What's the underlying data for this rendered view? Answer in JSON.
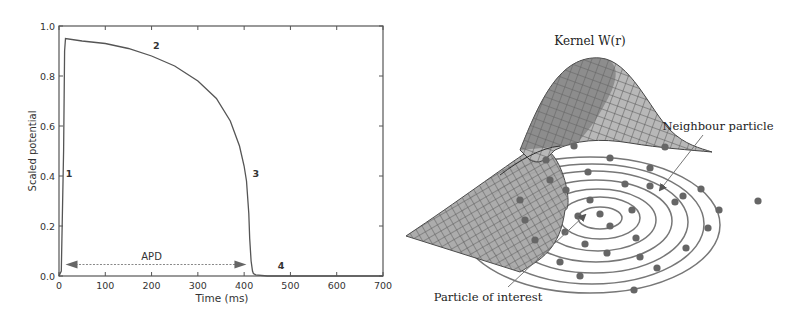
{
  "chart_data": {
    "type": "line",
    "title": "",
    "xlabel": "Time (ms)",
    "ylabel": "Scaled potential",
    "xlim": [
      0,
      700
    ],
    "ylim": [
      0.0,
      1.0
    ],
    "xticks": [
      "0",
      "100",
      "200",
      "300",
      "400",
      "500",
      "600",
      "700"
    ],
    "yticks": [
      "0.0",
      "0.2",
      "0.4",
      "0.6",
      "0.8",
      "1.0"
    ],
    "grid": false,
    "series": [
      {
        "name": "Action potential",
        "x": [
          0,
          5,
          10,
          12,
          14,
          50,
          100,
          150,
          200,
          250,
          300,
          340,
          370,
          390,
          400,
          405,
          410,
          412,
          415,
          418,
          420,
          425,
          450,
          500,
          600,
          700
        ],
        "y": [
          0.0,
          0.02,
          0.5,
          0.9,
          0.95,
          0.94,
          0.93,
          0.91,
          0.88,
          0.84,
          0.78,
          0.71,
          0.62,
          0.52,
          0.44,
          0.38,
          0.25,
          0.15,
          0.06,
          0.02,
          0.01,
          0.005,
          0.0,
          0.0,
          0.0,
          0.0
        ]
      }
    ],
    "annotations": [
      {
        "text": "1",
        "x": 22,
        "y": 0.41
      },
      {
        "text": "2",
        "x": 210,
        "y": 0.92
      },
      {
        "text": "3",
        "x": 425,
        "y": 0.41
      },
      {
        "text": "4",
        "x": 480,
        "y": 0.04
      },
      {
        "text": "APD",
        "x": 200,
        "y": 0.07,
        "type": "double-arrow",
        "from": 14,
        "to": 405
      }
    ]
  },
  "diagram": {
    "title": "Kernel W(r)",
    "labels": {
      "neighbour": "Neighbour particle",
      "interest": "Particle of interest"
    }
  }
}
